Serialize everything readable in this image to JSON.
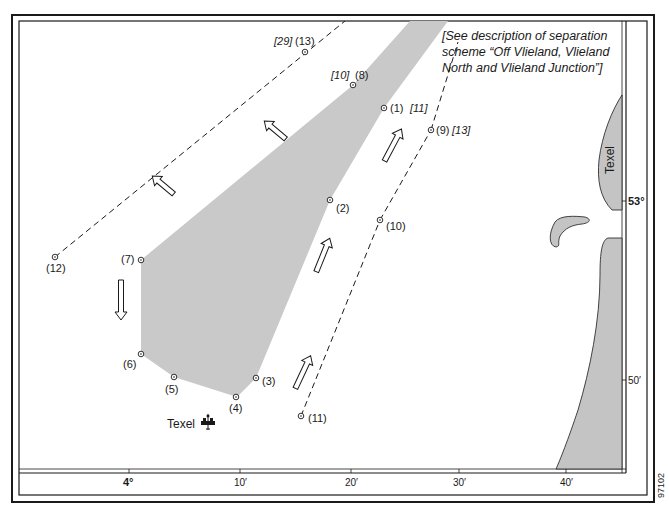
{
  "map": {
    "colors": {
      "land": "#c4c4c4",
      "zone": "#c9c9c9",
      "line": "#1a1a1a",
      "background": "#ffffff"
    },
    "note_lines": [
      "[See description of separation",
      "scheme “Off Vlieland, Vlieland",
      "North and Vlieland Junction”]"
    ],
    "points": [
      {
        "id": "1",
        "label": "(1)",
        "ref": "[11]"
      },
      {
        "id": "2",
        "label": "(2)",
        "ref": ""
      },
      {
        "id": "3",
        "label": "(3)",
        "ref": ""
      },
      {
        "id": "4",
        "label": "(4)",
        "ref": ""
      },
      {
        "id": "5",
        "label": "(5)",
        "ref": ""
      },
      {
        "id": "6",
        "label": "(6)",
        "ref": ""
      },
      {
        "id": "7",
        "label": "(7)",
        "ref": ""
      },
      {
        "id": "8",
        "label": "(8)",
        "ref": "[10]"
      },
      {
        "id": "9",
        "label": "(9)",
        "ref": "[13]"
      },
      {
        "id": "10",
        "label": "(10)",
        "ref": ""
      },
      {
        "id": "11",
        "label": "(11)",
        "ref": ""
      },
      {
        "id": "12",
        "label": "(12)",
        "ref": ""
      },
      {
        "id": "13",
        "label": "(13)",
        "ref": "[29]"
      }
    ],
    "place_labels": {
      "texel_island": "Texel",
      "texel_lightvessel": "Texel"
    },
    "longitude_ticks": [
      "4°",
      "10′",
      "20′",
      "30′",
      "40′"
    ],
    "latitude_ticks": [
      "53°",
      "50′"
    ],
    "figure_id": "97102",
    "icons": {
      "lightvessel": "lightvessel-symbol",
      "position": "circle-position-marker",
      "traffic_direction": "hollow-arrow"
    }
  }
}
